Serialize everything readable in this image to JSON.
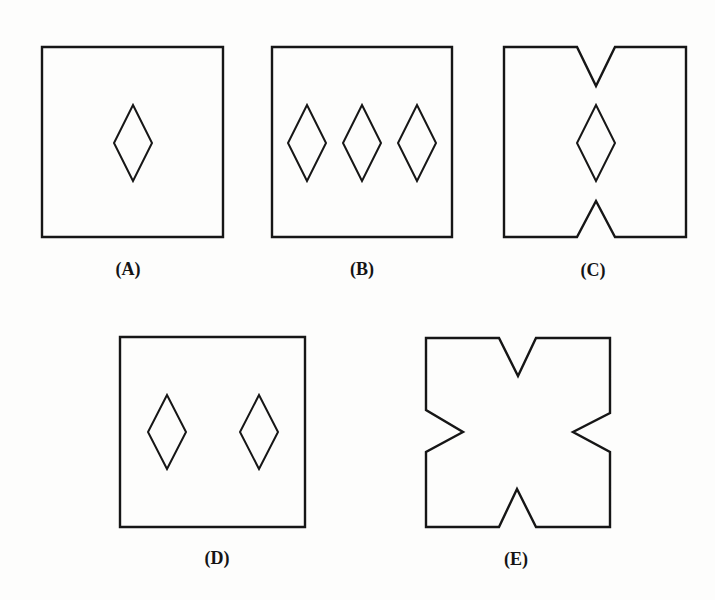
{
  "figure": {
    "colors": {
      "background": "#fdfdfc",
      "stroke": "#161616"
    },
    "options": [
      {
        "id": "A",
        "label": "(A)",
        "label_pos": [
          128,
          269
        ],
        "outline": [
          [
            42,
            47
          ],
          [
            223,
            47
          ],
          [
            223,
            237
          ],
          [
            42,
            237
          ]
        ],
        "diamonds": [
          {
            "cx": 133,
            "cy": 143,
            "hw": 19,
            "hh": 38
          }
        ]
      },
      {
        "id": "B",
        "label": "(B)",
        "label_pos": [
          362,
          269
        ],
        "outline": [
          [
            272,
            47
          ],
          [
            452,
            47
          ],
          [
            452,
            237
          ],
          [
            272,
            237
          ]
        ],
        "diamonds": [
          {
            "cx": 307,
            "cy": 143,
            "hw": 19,
            "hh": 38
          },
          {
            "cx": 362,
            "cy": 143,
            "hw": 19,
            "hh": 38
          },
          {
            "cx": 417,
            "cy": 143,
            "hw": 19,
            "hh": 38
          }
        ]
      },
      {
        "id": "C",
        "label": "(C)",
        "label_pos": [
          593,
          270
        ],
        "outline": [
          [
            504,
            47
          ],
          [
            577,
            47
          ],
          [
            596,
            86
          ],
          [
            615,
            47
          ],
          [
            686,
            47
          ],
          [
            686,
            237
          ],
          [
            615,
            237
          ],
          [
            596,
            201
          ],
          [
            577,
            237
          ],
          [
            504,
            237
          ]
        ],
        "diamonds": [
          {
            "cx": 596,
            "cy": 143,
            "hw": 19,
            "hh": 38
          }
        ]
      },
      {
        "id": "D",
        "label": "(D)",
        "label_pos": [
          217,
          558
        ],
        "outline": [
          [
            120,
            337
          ],
          [
            305,
            337
          ],
          [
            305,
            527
          ],
          [
            120,
            527
          ]
        ],
        "diamonds": [
          {
            "cx": 167,
            "cy": 432,
            "hw": 19,
            "hh": 37
          },
          {
            "cx": 259,
            "cy": 432,
            "hw": 19,
            "hh": 37
          }
        ]
      },
      {
        "id": "E",
        "label": "(E)",
        "label_pos": [
          516,
          559
        ],
        "outline": [
          [
            426,
            338
          ],
          [
            499,
            338
          ],
          [
            518,
            376
          ],
          [
            536,
            338
          ],
          [
            610,
            338
          ],
          [
            610,
            413
          ],
          [
            573,
            432
          ],
          [
            610,
            452
          ],
          [
            610,
            527
          ],
          [
            536,
            527
          ],
          [
            517,
            489
          ],
          [
            499,
            527
          ],
          [
            426,
            527
          ],
          [
            426,
            452
          ],
          [
            463,
            432
          ],
          [
            426,
            410
          ]
        ],
        "diamonds": []
      }
    ]
  }
}
